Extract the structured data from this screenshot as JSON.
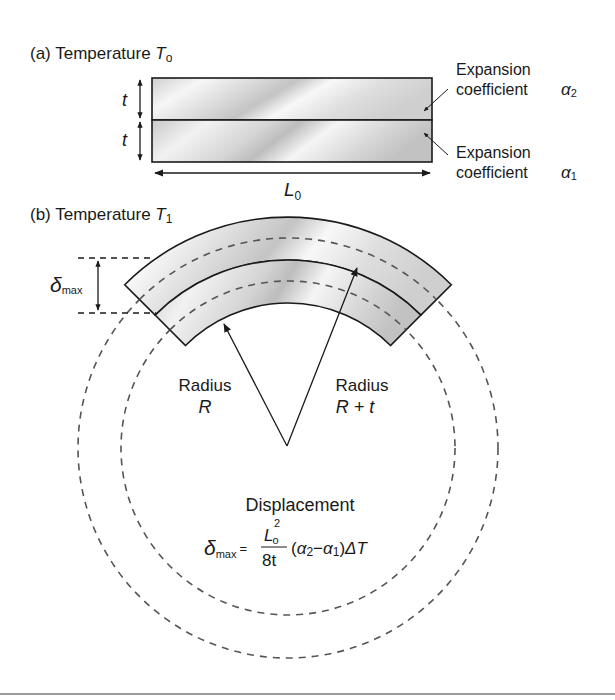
{
  "panel_a": {
    "label": "(a) Temperature ",
    "temp_symbol": "T",
    "temp_sub": "o",
    "thickness_label_top": "t",
    "thickness_label_bottom": "t",
    "length_label": "L",
    "length_sub": "0",
    "top_layer": {
      "line1": "Expansion",
      "line2": "coefficient",
      "symbol": "α",
      "symbol_sub": "2"
    },
    "bottom_layer": {
      "line1": "Expansion",
      "line2": "coefficient",
      "symbol": "α",
      "symbol_sub": "1"
    }
  },
  "panel_b": {
    "label": "(b) Temperature ",
    "temp_symbol": "T",
    "temp_sub": "1",
    "delta_symbol": "δ",
    "delta_sub": "max",
    "radius_left": {
      "line1": "Radius",
      "line2": "R"
    },
    "radius_right": {
      "line1": "Radius",
      "line2": "R + t"
    },
    "displacement_title": "Displacement",
    "formula": {
      "lhs": "δ",
      "lhs_sub": "max",
      "equals": "=",
      "num": "L",
      "num_sub": "o",
      "num_sup": "2",
      "den": "8t",
      "rest_open": "(",
      "a2": "α",
      "a2_sub": "2",
      "minus": "−",
      "a1": "α",
      "a1_sub": "1",
      "rest_close": ")",
      "delta_T": "ΔT"
    }
  },
  "colors": {
    "stroke": "#1a1a1a",
    "dash": "#555555",
    "band_light": "#f4f4f4",
    "band_dark": "#c9c9c9"
  }
}
